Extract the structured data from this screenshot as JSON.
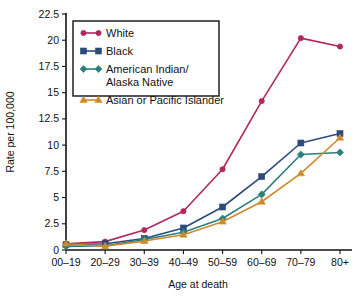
{
  "chart_data": {
    "type": "line",
    "title": "",
    "xlabel": "Age at death",
    "ylabel": "Rate per 100,000",
    "categories": [
      "00–19",
      "20–29",
      "30–39",
      "40–49",
      "50–59",
      "60–69",
      "70–79",
      "80+"
    ],
    "ylim": [
      0,
      22.5
    ],
    "yticks": [
      0,
      2.5,
      5,
      7.5,
      10,
      12.5,
      15,
      17.5,
      20,
      22.5
    ],
    "ytick_labels": [
      "0",
      "2.5",
      "5",
      "7.5",
      "10",
      "12.5",
      "15",
      "17.5",
      "20",
      "22.5"
    ],
    "grid": false,
    "legend_position": "top-left",
    "series": [
      {
        "name": "White",
        "color": "#B0285C",
        "marker": "circle",
        "values": [
          0.6,
          0.8,
          1.9,
          3.7,
          7.7,
          14.2,
          20.2,
          19.4
        ]
      },
      {
        "name": "Black",
        "color": "#2C4A7C",
        "marker": "square",
        "values": [
          0.5,
          0.6,
          1.1,
          2.1,
          4.1,
          7.0,
          10.2,
          11.1
        ]
      },
      {
        "name": "American Indian/\nAlaska Native",
        "legend_line_1": "American Indian/",
        "legend_line_2": "Alaska Native",
        "color": "#2E7F7A",
        "marker": "diamond",
        "values": [
          0.35,
          0.4,
          1.0,
          1.7,
          3.0,
          5.3,
          9.1,
          9.3
        ]
      },
      {
        "name": "Asian or Pacific Islander",
        "color": "#CE8A2C",
        "marker": "triangle",
        "values": [
          0.6,
          0.35,
          0.85,
          1.45,
          2.7,
          4.6,
          7.3,
          10.7
        ]
      }
    ]
  }
}
